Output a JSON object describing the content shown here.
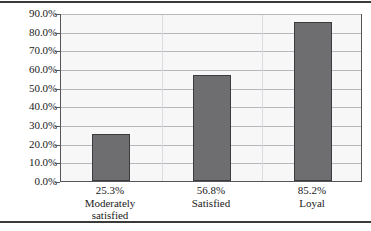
{
  "chart_data": {
    "type": "bar",
    "title": "",
    "subtitle": "",
    "xlabel": "",
    "ylabel": "",
    "categories": [
      "Moderately satisfied",
      "Satisfied",
      "Loyal"
    ],
    "category_lines": [
      [
        "Moderately",
        "satisfied"
      ],
      [
        "Satisfied"
      ],
      [
        "Loyal"
      ]
    ],
    "values": [
      25.3,
      56.8,
      85.2
    ],
    "value_labels": [
      "25.3%",
      "56.8%",
      "85.2%"
    ],
    "ylim": [
      0,
      90
    ],
    "ytick_values": [
      0,
      10,
      20,
      30,
      40,
      50,
      60,
      70,
      80,
      90
    ],
    "ytick_labels": [
      "0.0%",
      "10.0%",
      "20.0%",
      "30.0%",
      "40.0%",
      "50.0%",
      "60.0%",
      "70.0%",
      "80.0%",
      "90.0%"
    ],
    "grid": true,
    "legend": false,
    "legend_position": "none",
    "colors": {
      "bar_fill": "#6e6e70",
      "bar_outline": "#3c3c40",
      "plot_background": "#f7f7f7",
      "gridline": "#b8b8bc",
      "frame": "#55555a",
      "rule": "#3a3a3a",
      "text": "#1a1a1a"
    }
  }
}
